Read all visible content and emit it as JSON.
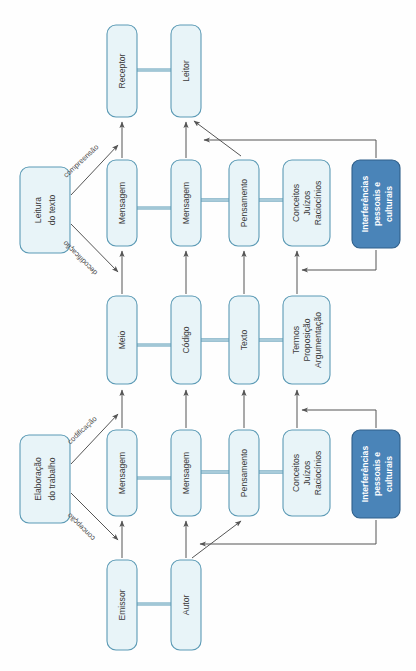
{
  "diagram": {
    "orientation": "rotated-90-ccw",
    "colors": {
      "node_fill": "#e8f4f8",
      "node_stroke": "#5b9ab5",
      "accent_fill": "#4a84b8",
      "accent_stroke": "#2f5f8a",
      "accent_text": "#ffffff",
      "text": "#3b3b3b",
      "arrow": "#555555",
      "background": "#ffffff"
    },
    "nodes": {
      "receptor": {
        "label": "Receptor"
      },
      "leitor": {
        "label": "Leitor"
      },
      "emissor": {
        "label": "Emissor"
      },
      "autor": {
        "label": "Autor"
      },
      "leitura_do_texto": {
        "line1": "Leitura",
        "line2": "do texto"
      },
      "elaboracao_do_trabalho": {
        "line1": "Elaboração",
        "line2": "do trabalho"
      },
      "top_mensagem_1": {
        "label": "Mensagem"
      },
      "top_mensagem_2": {
        "label": "Mensagem"
      },
      "top_pensamento": {
        "label": "Pensamento"
      },
      "top_conceitos": {
        "line1": "Conceitos",
        "line2": "Juízos",
        "line3": "Raciocínios"
      },
      "mid_meio": {
        "label": "Meio"
      },
      "mid_codigo": {
        "label": "Código"
      },
      "mid_texto": {
        "label": "Texto"
      },
      "mid_termos": {
        "line1": "Termos",
        "line2": "Proposição",
        "line3": "Argumentação"
      },
      "bot_mensagem_1": {
        "label": "Mensagem"
      },
      "bot_mensagem_2": {
        "label": "Mensagem"
      },
      "bot_pensamento": {
        "label": "Pensamento"
      },
      "bot_conceitos": {
        "line1": "Conceitos",
        "line2": "Juízos",
        "line3": "Raciocínios"
      },
      "interferencias_top": {
        "line1": "Interferências",
        "line2": "pessoais e",
        "line3": "culturais"
      },
      "interferencias_bottom": {
        "line1": "Interferências",
        "line2": "pessoais e",
        "line3": "culturais"
      }
    },
    "edge_labels": {
      "compreensao": "compreensão",
      "decodificacao": "decodificação",
      "codificacao": "codificação",
      "concepcao": "concepção"
    }
  }
}
